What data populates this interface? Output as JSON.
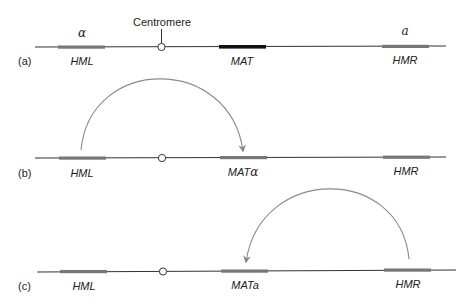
{
  "colors": {
    "chromosome_line": "#333333",
    "silent_locus": "#777777",
    "active_mat": "#111111",
    "arrow": "#8a8a8a",
    "text": "#222222"
  },
  "centromere": {
    "label": "Centromere"
  },
  "panels": [
    {
      "id": "a",
      "label": "(a)",
      "loci": [
        {
          "name": "HML",
          "above": "α"
        },
        {
          "name": "MAT",
          "above": ""
        },
        {
          "name": "HMR",
          "above": "a"
        }
      ]
    },
    {
      "id": "b",
      "label": "(b)",
      "loci": [
        {
          "name": "HML"
        },
        {
          "name": "MAT",
          "suffix": "α"
        },
        {
          "name": "HMR"
        }
      ],
      "arrow": {
        "from": "HML",
        "to": "MAT"
      }
    },
    {
      "id": "c",
      "label": "(c)",
      "loci": [
        {
          "name": "HML"
        },
        {
          "name": "MAT",
          "suffix": "a"
        },
        {
          "name": "HMR"
        }
      ],
      "arrow": {
        "from": "HMR",
        "to": "MAT"
      }
    }
  ]
}
